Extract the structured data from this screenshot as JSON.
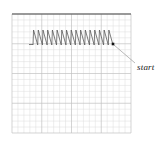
{
  "figure": {
    "background_color": "#ffffff",
    "canvas": {
      "width": 165,
      "height": 148
    }
  },
  "grid": {
    "name": "graph-paper-grid",
    "x": 12,
    "y": 14,
    "width": 119,
    "height": 119,
    "minor_step": 5.95,
    "minor_count_x": 20,
    "minor_count_y": 20,
    "major_every": 5,
    "minor_color": "#dcdcdc",
    "major_color": "#c2c2c2",
    "minor_width": 0.5,
    "major_width": 0.7,
    "top_border_color": "#4a4a4a",
    "top_border_width": 1.1
  },
  "path": {
    "name": "zigzag-waveform",
    "description": "sawtooth zigzag traversing left to right",
    "color": "#5a5a5a",
    "stroke_width": 0.8,
    "peak_count": 17,
    "x_start": 33,
    "x_end": 113,
    "y_top": 30,
    "y_bottom": 45,
    "tail": {
      "name": "path-tail",
      "x1": 29,
      "y1": 44.5,
      "x2": 33,
      "y2": 44.5
    }
  },
  "marker": {
    "name": "start-point-marker",
    "shape": "filled-square-dot",
    "x": 113,
    "y": 44,
    "size": 2.6,
    "color": "#111111"
  },
  "leader": {
    "name": "start-leader-line",
    "x1": 114,
    "y1": 45,
    "x2": 135,
    "y2": 63,
    "color": "#8a8a8a",
    "stroke_width": 0.6
  },
  "labels": {
    "start": "start"
  }
}
